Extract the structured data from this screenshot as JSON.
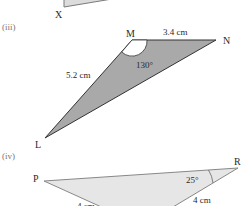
{
  "figures": [
    {
      "part": "",
      "vertices": [
        {
          "name": "X"
        }
      ]
    },
    {
      "part": "(iii)",
      "vertices": [
        {
          "name": "M"
        },
        {
          "name": "N"
        },
        {
          "name": "L"
        }
      ],
      "labels": {
        "mn": "3.4 cm",
        "ml": "5.2 cm",
        "angle_m": "130°"
      },
      "fill": "#a9a9a9"
    },
    {
      "part": "(iv)",
      "vertices": [
        {
          "name": "P"
        },
        {
          "name": "R"
        }
      ],
      "labels": {
        "angle_r": "25°",
        "r_side": "4 cm",
        "p_side": "4 cm"
      },
      "fill": "#e6e6e6"
    }
  ]
}
